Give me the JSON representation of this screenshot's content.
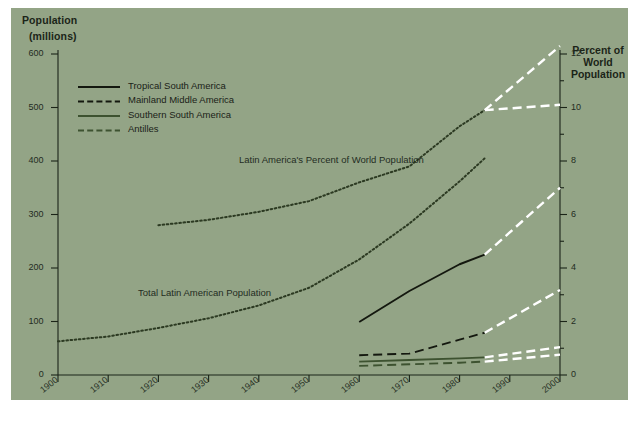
{
  "figure": {
    "background_color": "#ffffff",
    "plate_color": "#93a486",
    "ink_color": "#1b2418",
    "projection_color": "#ffffff",
    "series_green_color": "#3d5230"
  },
  "left_axis": {
    "title_line1": "Population",
    "title_line2": "(millions)",
    "ticks": [
      "600",
      "500",
      "400",
      "300",
      "200",
      "100",
      "0"
    ],
    "min": 0,
    "max": 600
  },
  "right_axis": {
    "title_line1": "Percent of",
    "title_line2": "World",
    "title_line3": "Population",
    "ticks": [
      "12",
      "10",
      "8",
      "6",
      "4",
      "2",
      "0"
    ],
    "min": 0,
    "max": 12
  },
  "x_axis": {
    "ticks": [
      "1900",
      "1910",
      "1920",
      "1930",
      "1940",
      "1950",
      "1960",
      "1970",
      "1980",
      "1990",
      "2000"
    ],
    "min": 1900,
    "max": 2000
  },
  "legend": {
    "items": [
      {
        "label": "Tropical South America",
        "style": "solid",
        "color": "#14180f"
      },
      {
        "label": "Mainland Middle America",
        "style": "dashed",
        "color": "#14180f"
      },
      {
        "label": "Southern South America",
        "style": "solid",
        "color": "#3d5230"
      },
      {
        "label": "Antilles",
        "style": "dashed",
        "color": "#3d5230"
      }
    ]
  },
  "annotations": [
    {
      "text": "Latin America's Percent of World Population"
    },
    {
      "text": "Total Latin American Population"
    }
  ],
  "chart_data": {
    "type": "line",
    "title": "",
    "subtitle": "",
    "xlabel": "",
    "ylabel": "Population (millions)",
    "y2label": "Percent of World Population",
    "xlim": [
      1900,
      2000
    ],
    "ylim": [
      0,
      600
    ],
    "y2lim": [
      0,
      12
    ],
    "grid": false,
    "legend_position": "upper-left",
    "series": [
      {
        "name": "Total Latin American Population",
        "axis": "left",
        "style": "dotted",
        "color": "#2c3a22",
        "x": [
          1900,
          1910,
          1920,
          1930,
          1940,
          1950,
          1960,
          1970,
          1980,
          1985
        ],
        "values": [
          63,
          72,
          88,
          106,
          130,
          163,
          216,
          283,
          362,
          405
        ]
      },
      {
        "name": "Latin America's Percent of World Population",
        "axis": "right",
        "style": "dotted",
        "color": "#2c3a22",
        "x": [
          1920,
          1930,
          1940,
          1950,
          1960,
          1970,
          1980,
          1985
        ],
        "values": [
          5.6,
          5.8,
          6.1,
          6.5,
          7.2,
          7.8,
          9.3,
          9.9
        ]
      },
      {
        "name": "Latin America's Percent of World Population (projection high)",
        "axis": "right",
        "style": "dashed",
        "color": "#ffffff",
        "x": [
          1985,
          2000
        ],
        "values": [
          9.9,
          12.3
        ]
      },
      {
        "name": "Latin America's Percent of World Population (projection low)",
        "axis": "right",
        "style": "dashed",
        "color": "#ffffff",
        "x": [
          1985,
          2000
        ],
        "values": [
          9.9,
          10.1
        ]
      },
      {
        "name": "Tropical South America",
        "axis": "left",
        "style": "solid",
        "color": "#14180f",
        "x": [
          1960,
          1970,
          1980,
          1985
        ],
        "values": [
          99,
          157,
          207,
          225
        ]
      },
      {
        "name": "Tropical South America (projection)",
        "axis": "left",
        "style": "dashed",
        "color": "#ffffff",
        "x": [
          1985,
          2000
        ],
        "values": [
          225,
          350
        ]
      },
      {
        "name": "Mainland Middle America",
        "axis": "left",
        "style": "dashed",
        "color": "#14180f",
        "x": [
          1960,
          1970,
          1980,
          1985
        ],
        "values": [
          37,
          40,
          66,
          79
        ]
      },
      {
        "name": "Mainland Middle America (projection)",
        "axis": "left",
        "style": "dashed",
        "color": "#ffffff",
        "x": [
          1985,
          2000
        ],
        "values": [
          79,
          159
        ]
      },
      {
        "name": "Southern South America",
        "axis": "left",
        "style": "solid",
        "color": "#3d5230",
        "x": [
          1960,
          1970,
          1980,
          1985
        ],
        "values": [
          25,
          28,
          31,
          33
        ]
      },
      {
        "name": "Southern South America (projection)",
        "axis": "left",
        "style": "dashed",
        "color": "#ffffff",
        "x": [
          1985,
          2000
        ],
        "values": [
          33,
          52
        ]
      },
      {
        "name": "Antilles",
        "axis": "left",
        "style": "dashed",
        "color": "#3d5230",
        "x": [
          1960,
          1970,
          1980,
          1985
        ],
        "values": [
          17,
          20,
          23,
          25
        ]
      },
      {
        "name": "Antilles (projection)",
        "axis": "left",
        "style": "dashed",
        "color": "#ffffff",
        "x": [
          1985,
          2000
        ],
        "values": [
          25,
          38
        ]
      }
    ]
  }
}
